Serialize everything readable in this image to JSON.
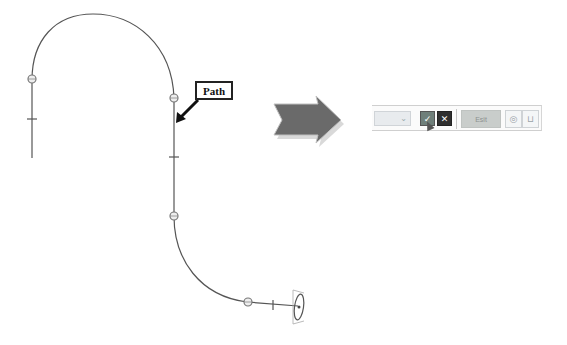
{
  "diagram": {
    "callout_label": "Path",
    "path_markers": {
      "circle_nodes": 5,
      "tick_marks": 4,
      "end_profile": "ellipse"
    },
    "transition_arrow": "right-arrow"
  },
  "toolbar": {
    "dropdown": {
      "value": "",
      "chevron": "⌄"
    },
    "ok_button": {
      "icon": "checkmark-icon",
      "glyph": "✓"
    },
    "cancel_button": {
      "icon": "close-icon",
      "glyph": "✕"
    },
    "wide_button_label": "Esit",
    "icon_button_1": {
      "icon": "view-icon",
      "glyph": "◎"
    },
    "icon_button_2": {
      "icon": "frame-icon",
      "glyph": "⊔"
    }
  },
  "colors": {
    "path_stroke": "#555555",
    "arrow_fill": "#6a6a6a",
    "ok_button": "#6f7f7a",
    "cancel_button": "#2f2f2f"
  }
}
